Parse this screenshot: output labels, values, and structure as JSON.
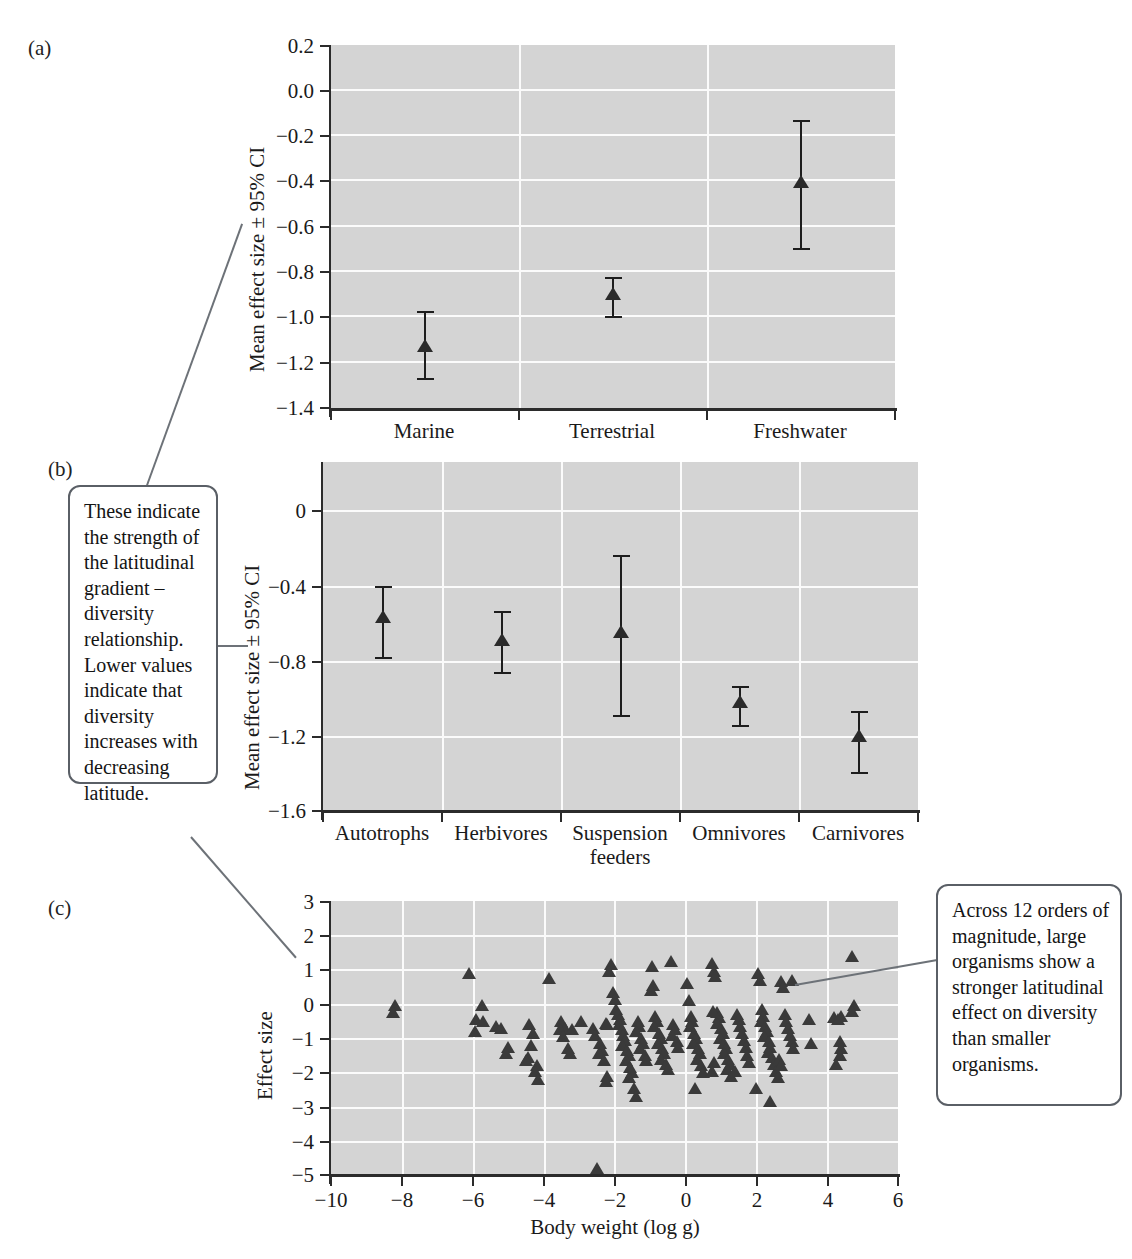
{
  "figure": {
    "panels": [
      {
        "tag": "(a)"
      },
      {
        "tag": "(b)"
      },
      {
        "tag": "(c)"
      }
    ]
  },
  "callouts": {
    "left": {
      "name": "callout-effect-size-explanation",
      "text": "These indicate the strength of the latitudinal gradient – diversity relationship. Lower values indicate that diversity increases with decreasing latitude."
    },
    "right": {
      "name": "callout-body-weight-explanation",
      "text": "Across 12 orders of magnitude, large organisms show a stronger latitudinal effect on diversity than smaller organisms."
    }
  },
  "chart_data": [
    {
      "type": "scatter",
      "panel": "a",
      "title": "",
      "xlabel": "",
      "ylabel": "Mean effect size ± 95% CI",
      "categories": [
        "Marine",
        "Terrestrial",
        "Freshwater"
      ],
      "values": [
        -1.13,
        -0.91,
        -0.405
      ],
      "ci_lower": [
        -1.27,
        -1.0,
        -0.7
      ],
      "ci_upper": [
        -0.97,
        -0.82,
        -0.13
      ],
      "ylim": [
        -1.4,
        0.2
      ],
      "yticks": [
        "0.2",
        "0.0",
        "−0.2",
        "−0.4",
        "−0.6",
        "−0.8",
        "−1.0",
        "−1.2",
        "−1.4"
      ],
      "ytick_values": [
        0.2,
        0.0,
        -0.2,
        -0.4,
        -0.6,
        -0.8,
        -1.0,
        -1.2,
        -1.4
      ],
      "grid": true,
      "legend": "none"
    },
    {
      "type": "scatter",
      "panel": "b",
      "title": "",
      "xlabel": "",
      "ylabel": "Mean effect size ± 95% CI",
      "categories": [
        "Autotrophs",
        "Herbivores",
        "Suspension feeders",
        "Omnivores",
        "Carnivores"
      ],
      "values": [
        -0.6,
        -0.72,
        -0.68,
        -1.06,
        -1.23
      ],
      "ci_lower": [
        -0.79,
        -0.87,
        -1.1,
        -1.16,
        -1.4
      ],
      "ci_upper": [
        -0.41,
        -0.54,
        -0.24,
        -0.95,
        -1.08
      ],
      "ylim": [
        -1.6,
        0.2
      ],
      "yticks": [
        "0",
        "−0.4",
        "−0.8",
        "−1.2",
        "−1.6"
      ],
      "ytick_values": [
        0,
        -0.4,
        -0.8,
        -1.2,
        -1.6
      ],
      "grid": true,
      "legend": "none"
    },
    {
      "type": "scatter",
      "panel": "c",
      "title": "",
      "xlabel": "Body weight (log g)",
      "ylabel": "Effect size",
      "xlim": [
        -10,
        6
      ],
      "ylim": [
        -5,
        3
      ],
      "xticks": [
        "−10",
        "−8",
        "−6",
        "−4",
        "−2",
        "0",
        "2",
        "4",
        "6"
      ],
      "xtick_values": [
        -10,
        -8,
        -6,
        -4,
        -2,
        0,
        2,
        4,
        6
      ],
      "yticks": [
        "3",
        "2",
        "1",
        "0",
        "−1",
        "−2",
        "−3",
        "−4",
        "−5"
      ],
      "ytick_values": [
        3,
        2,
        1,
        0,
        -1,
        -2,
        -3,
        -4,
        -5
      ],
      "grid": true,
      "legend": "none",
      "points": [
        [
          -8.2,
          -0.05
        ],
        [
          -8.25,
          -0.25
        ],
        [
          -6.1,
          0.9
        ],
        [
          -5.75,
          -0.05
        ],
        [
          -5.9,
          -0.45
        ],
        [
          -5.7,
          -0.5
        ],
        [
          -5.95,
          -0.8
        ],
        [
          -5.35,
          -0.65
        ],
        [
          -5.2,
          -0.7
        ],
        [
          -5.0,
          -1.25
        ],
        [
          -5.05,
          -1.45
        ],
        [
          -4.4,
          -0.6
        ],
        [
          -4.3,
          -0.85
        ],
        [
          -4.35,
          -1.2
        ],
        [
          -4.2,
          -1.8
        ],
        [
          -4.25,
          -1.95
        ],
        [
          -4.15,
          -2.2
        ],
        [
          -4.45,
          -1.55
        ],
        [
          -4.5,
          -1.65
        ],
        [
          -3.85,
          0.75
        ],
        [
          -3.5,
          -0.5
        ],
        [
          -3.4,
          -0.7
        ],
        [
          -3.55,
          -0.75
        ],
        [
          -3.45,
          -0.95
        ],
        [
          -3.2,
          -0.75
        ],
        [
          -3.3,
          -1.3
        ],
        [
          -3.25,
          -1.45
        ],
        [
          -2.95,
          -0.5
        ],
        [
          -2.6,
          -0.7
        ],
        [
          -2.55,
          -0.9
        ],
        [
          -2.4,
          -1.15
        ],
        [
          -2.35,
          -1.35
        ],
        [
          -2.45,
          -1.45
        ],
        [
          -2.3,
          -1.65
        ],
        [
          -2.25,
          -0.55
        ],
        [
          -2.2,
          -0.6
        ],
        [
          -2.5,
          -4.8
        ],
        [
          -2.1,
          1.15
        ],
        [
          -2.15,
          0.95
        ],
        [
          -2.05,
          0.35
        ],
        [
          -2.0,
          0.15
        ],
        [
          -1.95,
          -0.15
        ],
        [
          -1.9,
          -0.3
        ],
        [
          -1.85,
          -0.45
        ],
        [
          -1.88,
          -0.6
        ],
        [
          -1.8,
          -0.75
        ],
        [
          -1.75,
          -0.9
        ],
        [
          -1.7,
          -1.05
        ],
        [
          -1.78,
          -1.2
        ],
        [
          -1.65,
          -1.35
        ],
        [
          -1.6,
          -1.5
        ],
        [
          -1.68,
          -1.65
        ],
        [
          -1.55,
          -1.85
        ],
        [
          -1.5,
          -2.0
        ],
        [
          -1.58,
          -2.15
        ],
        [
          -1.45,
          -2.45
        ],
        [
          -1.4,
          -2.7
        ],
        [
          -2.2,
          -2.1
        ],
        [
          -2.25,
          -2.25
        ],
        [
          -1.35,
          -0.5
        ],
        [
          -1.3,
          -0.65
        ],
        [
          -1.38,
          -0.8
        ],
        [
          -1.25,
          -1.0
        ],
        [
          -1.2,
          -1.15
        ],
        [
          -1.28,
          -1.3
        ],
        [
          -1.15,
          -1.5
        ],
        [
          -1.1,
          -1.65
        ],
        [
          -0.95,
          1.1
        ],
        [
          -0.9,
          0.55
        ],
        [
          -0.98,
          0.4
        ],
        [
          -0.85,
          -0.35
        ],
        [
          -0.8,
          -0.5
        ],
        [
          -0.88,
          -0.65
        ],
        [
          -0.75,
          -0.85
        ],
        [
          -0.7,
          -1.0
        ],
        [
          -0.78,
          -1.15
        ],
        [
          -0.65,
          -1.3
        ],
        [
          -0.6,
          -1.45
        ],
        [
          -0.68,
          -1.6
        ],
        [
          -0.55,
          -1.75
        ],
        [
          -0.5,
          -1.9
        ],
        [
          -0.4,
          1.25
        ],
        [
          -0.35,
          -0.6
        ],
        [
          -0.3,
          -0.75
        ],
        [
          -0.38,
          -0.9
        ],
        [
          -0.25,
          -1.1
        ],
        [
          -0.2,
          -1.25
        ],
        [
          0.05,
          0.6
        ],
        [
          0.1,
          0.1
        ],
        [
          0.15,
          -0.35
        ],
        [
          0.2,
          -0.5
        ],
        [
          0.12,
          -0.65
        ],
        [
          0.25,
          -0.85
        ],
        [
          0.3,
          -1.0
        ],
        [
          0.22,
          -1.15
        ],
        [
          0.35,
          -1.3
        ],
        [
          0.4,
          -1.45
        ],
        [
          0.32,
          -1.6
        ],
        [
          0.45,
          -1.8
        ],
        [
          0.5,
          -2.0
        ],
        [
          0.28,
          -2.45
        ],
        [
          0.75,
          1.2
        ],
        [
          0.8,
          0.95
        ],
        [
          0.85,
          0.8
        ],
        [
          0.9,
          -0.25
        ],
        [
          0.95,
          -0.4
        ],
        [
          0.88,
          -0.55
        ],
        [
          1.0,
          -0.7
        ],
        [
          1.05,
          -0.85
        ],
        [
          0.98,
          -1.0
        ],
        [
          1.1,
          -1.15
        ],
        [
          1.15,
          -1.3
        ],
        [
          1.08,
          -1.45
        ],
        [
          1.2,
          -1.6
        ],
        [
          1.25,
          -1.75
        ],
        [
          1.18,
          -1.9
        ],
        [
          1.3,
          -2.1
        ],
        [
          0.78,
          -0.2
        ],
        [
          0.82,
          -1.7
        ],
        [
          0.76,
          -1.95
        ],
        [
          1.45,
          -0.3
        ],
        [
          1.5,
          -0.45
        ],
        [
          1.55,
          -0.65
        ],
        [
          1.6,
          -0.85
        ],
        [
          1.65,
          -1.05
        ],
        [
          1.7,
          -1.25
        ],
        [
          1.75,
          -1.5
        ],
        [
          1.8,
          -1.7
        ],
        [
          1.4,
          -1.95
        ],
        [
          2.05,
          0.9
        ],
        [
          2.1,
          0.7
        ],
        [
          2.15,
          -0.15
        ],
        [
          2.2,
          -0.35
        ],
        [
          2.12,
          -0.5
        ],
        [
          2.25,
          -0.65
        ],
        [
          2.3,
          -0.8
        ],
        [
          2.22,
          -0.95
        ],
        [
          2.35,
          -1.1
        ],
        [
          2.4,
          -1.25
        ],
        [
          2.32,
          -1.4
        ],
        [
          2.45,
          -1.55
        ],
        [
          2.5,
          -1.75
        ],
        [
          2.55,
          -1.95
        ],
        [
          2.6,
          -2.15
        ],
        [
          2.0,
          -2.45
        ],
        [
          2.4,
          -2.85
        ],
        [
          2.7,
          0.65
        ],
        [
          2.75,
          0.5
        ],
        [
          2.8,
          -0.3
        ],
        [
          2.85,
          -0.5
        ],
        [
          2.9,
          -0.7
        ],
        [
          2.95,
          -0.9
        ],
        [
          3.0,
          -1.1
        ],
        [
          3.05,
          -1.3
        ],
        [
          2.65,
          -1.6
        ],
        [
          2.7,
          -1.8
        ],
        [
          3.5,
          -0.45
        ],
        [
          3.55,
          -1.15
        ],
        [
          4.2,
          -0.4
        ],
        [
          4.3,
          -0.45
        ],
        [
          4.4,
          -0.35
        ],
        [
          4.35,
          -1.1
        ],
        [
          4.4,
          -1.3
        ],
        [
          4.35,
          -1.5
        ],
        [
          4.25,
          -1.75
        ],
        [
          4.7,
          1.4
        ],
        [
          4.75,
          -0.05
        ],
        [
          4.7,
          -0.2
        ],
        [
          3.0,
          0.7
        ]
      ]
    }
  ]
}
